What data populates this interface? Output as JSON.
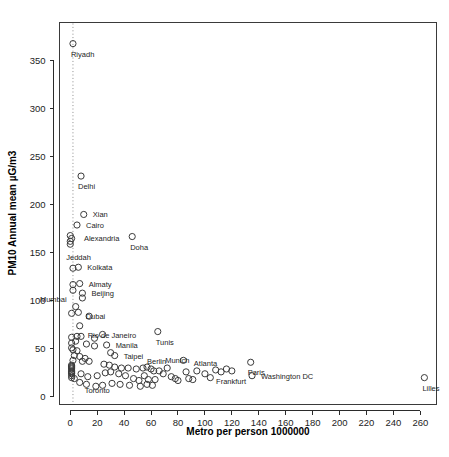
{
  "chart_data": {
    "type": "scatter",
    "title": "",
    "xlabel": "Metro per person 1000000",
    "ylabel": "PM10 Annual mean µG/m3",
    "xlim": [
      -8,
      272
    ],
    "ylim": [
      -8,
      390
    ],
    "xticks": [
      0,
      20,
      40,
      60,
      80,
      100,
      120,
      140,
      160,
      180,
      200,
      220,
      240,
      260
    ],
    "yticks": [
      0,
      50,
      100,
      150,
      200,
      250,
      300,
      350
    ],
    "grid": false,
    "legend": null,
    "marker": "open-circle",
    "annotations": [
      {
        "label": "Riyadh",
        "x": 2,
        "y": 368,
        "label_dx": -2,
        "label_dy": 13
      },
      {
        "label": "Delhi",
        "x": 8,
        "y": 230,
        "label_dx": -3,
        "label_dy": 13
      },
      {
        "label": "Xian",
        "x": 10,
        "y": 190,
        "label_dx": 9,
        "label_dy": 3
      },
      {
        "label": "Cairo",
        "x": 5,
        "y": 179,
        "label_dx": 9,
        "label_dy": 3
      },
      {
        "label": "Alexandria",
        "x": 2,
        "y": 165,
        "label_dx": 11,
        "label_dy": 3
      },
      {
        "label": "Jeddah",
        "x": 0,
        "y": 159,
        "label_dx": -4,
        "label_dy": 16
      },
      {
        "label": "Doha",
        "x": 46,
        "y": 167,
        "label_dx": -2,
        "label_dy": 13
      },
      {
        "label": "Kolkata",
        "x": 6,
        "y": 135,
        "label_dx": 9,
        "label_dy": 3
      },
      {
        "label": "Almaty",
        "x": 7,
        "y": 118,
        "label_dx": 9,
        "label_dy": 3
      },
      {
        "label": "Mumbai",
        "x": 2,
        "y": 111,
        "label_dx": -33,
        "label_dy": 12
      },
      {
        "label": "Beijing",
        "x": 9,
        "y": 108,
        "label_dx": 9,
        "label_dy": 3
      },
      {
        "label": "Dubai",
        "x": 4,
        "y": 94,
        "label_dx": 10,
        "label_dy": 12
      },
      {
        "label": "Rio de Janeiro",
        "x": 7,
        "y": 74,
        "label_dx": 8,
        "label_dy": 12
      },
      {
        "label": "Tunis",
        "x": 65,
        "y": 68,
        "label_dx": -2,
        "label_dy": 13
      },
      {
        "label": "Manila",
        "x": 27,
        "y": 54,
        "label_dx": 9,
        "label_dy": 3
      },
      {
        "label": "Taipei",
        "x": 33,
        "y": 43,
        "label_dx": 9,
        "label_dy": 3
      },
      {
        "label": "Berlin",
        "x": 54,
        "y": 30,
        "label_dx": 4,
        "label_dy": -4
      },
      {
        "label": "Munich",
        "x": 72,
        "y": 30,
        "label_dx": -2,
        "label_dy": -5
      },
      {
        "label": "Atlanta",
        "x": 94,
        "y": 27,
        "label_dx": -3,
        "label_dy": -5
      },
      {
        "label": "Frankfurt",
        "x": 112,
        "y": 26,
        "label_dx": -5,
        "label_dy": 12
      },
      {
        "label": "Paris",
        "x": 134,
        "y": 36,
        "label_dx": -3,
        "label_dy": 13
      },
      {
        "label": "Washington DC",
        "x": 135,
        "y": 22,
        "label_dx": 9,
        "label_dy": 3
      },
      {
        "label": "Lilles",
        "x": 263,
        "y": 20,
        "label_dx": -2,
        "label_dy": 13
      },
      {
        "label": "Toronto",
        "x": 7,
        "y": 15,
        "label_dx": 5,
        "label_dy": 11
      }
    ],
    "guide_line": {
      "type": "vertical-dotted",
      "x": 2
    },
    "points": [
      [
        2,
        368
      ],
      [
        8,
        230
      ],
      [
        10,
        190
      ],
      [
        5,
        179
      ],
      [
        0,
        168
      ],
      [
        1,
        165
      ],
      [
        0,
        162
      ],
      [
        0,
        159
      ],
      [
        46,
        167
      ],
      [
        2,
        134
      ],
      [
        6,
        135
      ],
      [
        2,
        117
      ],
      [
        7,
        118
      ],
      [
        2,
        111
      ],
      [
        9,
        108
      ],
      [
        9,
        103
      ],
      [
        4,
        94
      ],
      [
        1,
        87
      ],
      [
        6,
        88
      ],
      [
        14,
        84
      ],
      [
        7,
        74
      ],
      [
        65,
        68
      ],
      [
        1,
        62
      ],
      [
        5,
        63
      ],
      [
        8,
        63
      ],
      [
        18,
        61
      ],
      [
        24,
        65
      ],
      [
        1,
        56
      ],
      [
        4,
        58
      ],
      [
        12,
        55
      ],
      [
        18,
        53
      ],
      [
        27,
        54
      ],
      [
        1,
        51
      ],
      [
        2,
        49
      ],
      [
        5,
        48
      ],
      [
        3,
        43
      ],
      [
        7,
        42
      ],
      [
        11,
        40
      ],
      [
        33,
        43
      ],
      [
        30,
        46
      ],
      [
        2,
        38
      ],
      [
        9,
        37
      ],
      [
        14,
        37
      ],
      [
        1,
        33
      ],
      [
        1,
        32
      ],
      [
        1,
        31
      ],
      [
        1,
        30
      ],
      [
        1,
        29
      ],
      [
        25,
        34
      ],
      [
        29,
        33
      ],
      [
        33,
        31
      ],
      [
        38,
        30
      ],
      [
        43,
        30
      ],
      [
        49,
        29
      ],
      [
        54,
        30
      ],
      [
        57,
        31
      ],
      [
        60,
        29
      ],
      [
        62,
        27
      ],
      [
        1,
        27
      ],
      [
        1,
        26
      ],
      [
        1,
        25
      ],
      [
        1,
        24
      ],
      [
        8,
        24
      ],
      [
        13,
        21
      ],
      [
        20,
        22
      ],
      [
        26,
        25
      ],
      [
        30,
        26
      ],
      [
        36,
        24
      ],
      [
        41,
        22
      ],
      [
        47,
        19
      ],
      [
        51,
        17
      ],
      [
        55,
        22
      ],
      [
        58,
        18
      ],
      [
        63,
        18
      ],
      [
        66,
        27
      ],
      [
        69,
        24
      ],
      [
        72,
        30
      ],
      [
        75,
        21
      ],
      [
        78,
        19
      ],
      [
        80,
        17
      ],
      [
        84,
        38
      ],
      [
        86,
        26
      ],
      [
        88,
        19
      ],
      [
        91,
        18
      ],
      [
        94,
        27
      ],
      [
        100,
        24
      ],
      [
        104,
        20
      ],
      [
        108,
        28
      ],
      [
        112,
        26
      ],
      [
        116,
        29
      ],
      [
        120,
        27
      ],
      [
        134,
        36
      ],
      [
        135,
        22
      ],
      [
        1,
        22
      ],
      [
        1,
        20
      ],
      [
        3,
        19
      ],
      [
        7,
        15
      ],
      [
        12,
        13
      ],
      [
        19,
        11
      ],
      [
        24,
        12
      ],
      [
        31,
        14
      ],
      [
        37,
        13
      ],
      [
        44,
        12
      ],
      [
        52,
        11
      ],
      [
        57,
        13
      ],
      [
        61,
        12
      ],
      [
        263,
        20
      ]
    ]
  }
}
